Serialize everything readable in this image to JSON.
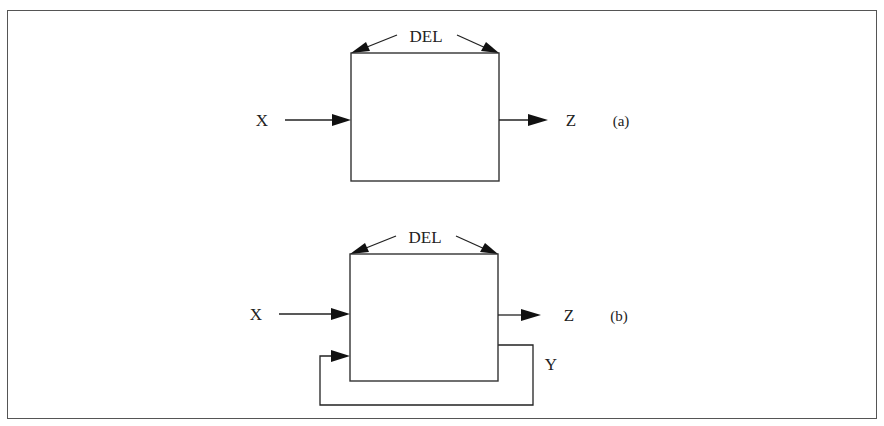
{
  "figure": {
    "frame_color": "#555555",
    "ink_color": "#222222",
    "panels": [
      {
        "id": "a",
        "tag": "(a)",
        "block_param": "DEL",
        "input": "X",
        "output": "Z"
      },
      {
        "id": "b",
        "tag": "(b)",
        "block_param": "DEL",
        "input": "X",
        "output": "Z",
        "feedback": "Y"
      }
    ]
  }
}
